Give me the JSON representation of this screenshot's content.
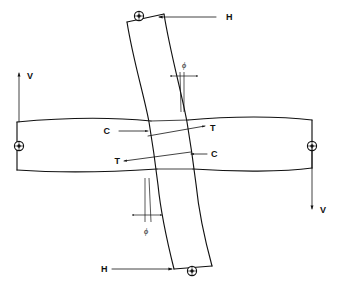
{
  "figure": {
    "background_color": "#ffffff",
    "line_color": "#111111",
    "width": 341,
    "height": 291
  },
  "labels": {
    "force_h_top": "H",
    "force_h_bottom": "H",
    "force_v_left": "V",
    "force_v_right": "V",
    "compression_top": "C",
    "tension_top": "T",
    "tension_bottom": "T",
    "compression_bottom": "C",
    "angle_top": "ϕ",
    "angle_bottom": "ϕ"
  },
  "annotations": [
    {
      "name": "force-h-top",
      "text": "H",
      "x": 226,
      "y": 19,
      "arrow_direction": "left"
    },
    {
      "name": "force-h-bottom",
      "text": "H",
      "x": 100,
      "y": 272,
      "arrow_direction": "right"
    },
    {
      "name": "force-v-left",
      "text": "V",
      "x": 29,
      "y": 78,
      "arrow_direction": "up"
    },
    {
      "name": "force-v-right",
      "text": "V",
      "x": 322,
      "y": 211,
      "arrow_direction": "down"
    },
    {
      "name": "compression-top",
      "text": "C",
      "x": 112,
      "y": 134,
      "arrow_direction": "right"
    },
    {
      "name": "tension-top",
      "text": "T",
      "x": 213,
      "y": 131,
      "arrow_direction": "right"
    },
    {
      "name": "tension-bottom",
      "text": "T",
      "x": 117,
      "y": 163,
      "arrow_direction": "left"
    },
    {
      "name": "compression-bottom",
      "text": "C",
      "x": 214,
      "y": 157,
      "arrow_direction": "left"
    },
    {
      "name": "angle-phi-top",
      "text": "ϕ",
      "x": 186,
      "y": 66,
      "arrow_direction": "dimension"
    },
    {
      "name": "angle-phi-bottom",
      "text": "ϕ",
      "x": 146,
      "y": 232,
      "arrow_direction": "dimension"
    }
  ],
  "members": {
    "horizontal_beam": {
      "name": "horizontal-beam",
      "description": "beam deformed in flexure, interrupted by the column at the joint"
    },
    "vertical_column": {
      "name": "vertical-column",
      "description": "column deformed in double curvature (S-shape)"
    }
  },
  "connectors": [
    {
      "name": "pin-support-top",
      "x": 139,
      "y": 16
    },
    {
      "name": "pin-support-left",
      "x": 19,
      "y": 146
    },
    {
      "name": "pin-support-right",
      "x": 312,
      "y": 146
    },
    {
      "name": "pin-support-bottom",
      "x": 192,
      "y": 271
    }
  ]
}
